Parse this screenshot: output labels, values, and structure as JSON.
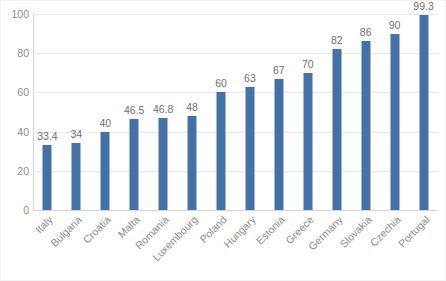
{
  "chart_data": {
    "type": "bar",
    "title": "",
    "subtitle": "",
    "xlabel": "",
    "ylabel": "",
    "ylim": [
      0,
      100
    ],
    "yticks": [
      "0",
      "20",
      "40",
      "60",
      "80",
      "100"
    ],
    "grid": "horizontal",
    "legend": "none",
    "bar_color": "#4472a8",
    "categories": [
      "Italy",
      "Bulgaria",
      "Croatia",
      "Malta",
      "Romania",
      "Luxembourg",
      "Poland",
      "Hungary",
      "Estonia",
      "Greece",
      "Germany",
      "Slovakia",
      "Czechia",
      "Portugal"
    ],
    "values": [
      33.4,
      34,
      40,
      46.5,
      46.8,
      48,
      60,
      63,
      67,
      70,
      82,
      86,
      90,
      99.3
    ],
    "data_labels": [
      "33.4",
      "34",
      "40",
      "46.5",
      "46.8",
      "48",
      "60",
      "63",
      "67",
      "70",
      "82",
      "86",
      "90",
      "99.3"
    ]
  }
}
